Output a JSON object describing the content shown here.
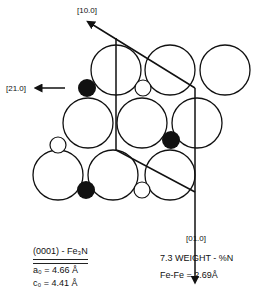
{
  "diagram": {
    "directions": [
      {
        "label": "[10.0]"
      },
      {
        "label": "[21.0]"
      },
      {
        "label": "[01.0]"
      }
    ],
    "atoms": {
      "large": [
        [
          116,
          70
        ],
        [
          170,
          70
        ],
        [
          225,
          70
        ],
        [
          88,
          123
        ],
        [
          142,
          123
        ],
        [
          197,
          123
        ],
        [
          58,
          175
        ],
        [
          113,
          175
        ],
        [
          170,
          175
        ]
      ],
      "black": [
        [
          87,
          88
        ],
        [
          171,
          140
        ],
        [
          86,
          190
        ]
      ],
      "small_white": [
        [
          143,
          88
        ],
        [
          58,
          145
        ],
        [
          142,
          190
        ]
      ]
    },
    "colors": {
      "line": "#111111",
      "fill_black": "#111111",
      "background": "#ffffff"
    }
  },
  "caption": {
    "left": {
      "heading": "(0001) - Fe₃N",
      "a0": "a₀  = 4.66 Å",
      "c0": "c₀  = 4.41 Å"
    },
    "right": {
      "weight": "7.3  WEIGHT - %N",
      "fefe": "Fe-Fe = 2.69Å"
    }
  }
}
